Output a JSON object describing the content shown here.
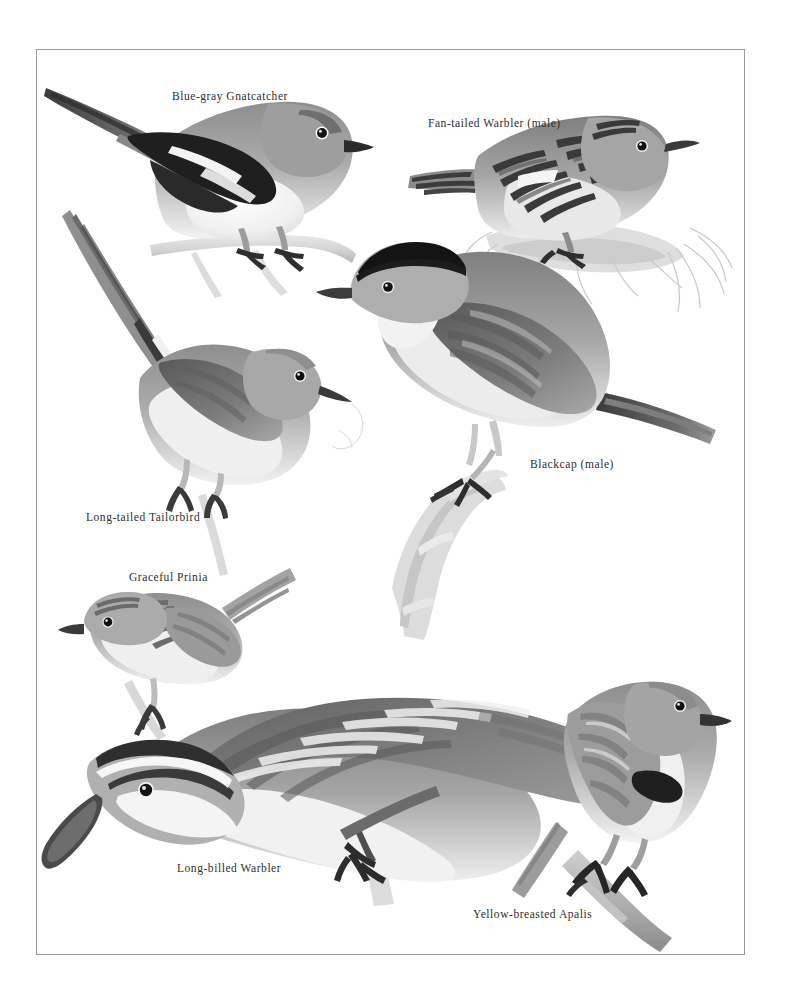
{
  "plate": {
    "kind": "field-guide-illustration-plate",
    "medium": "grayscale-watercolor-painting",
    "page_background": "#ffffff",
    "border_color": "#9a9a9a",
    "caption_color": "#2e2e2e",
    "ink_dark": "#2a2a2a",
    "ink_mid": "#8d8d8d",
    "ink_light": "#d6d6d6"
  },
  "captions": {
    "gnatcatcher": "Blue-gray Gnatcatcher",
    "fantailed_warbler": "Fan-tailed Warbler (male)",
    "blackcap": "Blackcap (male)",
    "tailorbird": "Long-tailed Tailorbird",
    "prinia": "Graceful Prinia",
    "longbilled_warbler": "Long-billed Warbler",
    "apalis": "Yellow-breasted Apalis"
  },
  "figures": [
    {
      "id": "gnatcatcher",
      "label": "Blue-gray Gnatcatcher",
      "facing": "right",
      "pose": "perched on twig, long tail swept to upper-left",
      "features": [
        "long black-and-white tail",
        "black wing with white edging",
        "blue-gray back",
        "white underparts",
        "fine black bill",
        "white eye-ring"
      ]
    },
    {
      "id": "fantailed_warbler",
      "label": "Fan-tailed Warbler (male)",
      "facing": "right",
      "pose": "perched on grass tussock",
      "features": [
        "heavily dark-streaked back",
        "buff underparts",
        "short fanned tail",
        "streaked crown"
      ]
    },
    {
      "id": "blackcap",
      "label": "Blackcap (male)",
      "facing": "left",
      "pose": "perched upright on lichen-covered branch",
      "features": [
        "solid black crown cap",
        "gray nape and back",
        "pale gray underparts",
        "long gray tail"
      ]
    },
    {
      "id": "tailorbird",
      "label": "Long-tailed Tailorbird",
      "facing": "right",
      "pose": "crouched on stem, tail raised steeply",
      "features": [
        "extremely long needle tail",
        "rufous crown",
        "pale whitish underparts",
        "slender decurved bill"
      ]
    },
    {
      "id": "prinia",
      "label": "Graceful Prinia",
      "facing": "left",
      "pose": "perched on thin stem, tail cocked up",
      "features": [
        "fine dark streaking above",
        "pale buff below",
        "long graduated tail",
        "short fine bill"
      ]
    },
    {
      "id": "longbilled_warbler",
      "label": "Long-billed Warbler",
      "facing": "left-down",
      "pose": "large descending pose, wings swept back",
      "features": [
        "very long decurved bill",
        "bold white supercilium",
        "dark crown stripes",
        "long pointed wings",
        "white underparts"
      ]
    },
    {
      "id": "apalis",
      "label": "Yellow-breasted Apalis",
      "facing": "right",
      "pose": "perched on angled branch",
      "features": [
        "dark breast band",
        "pale grey head",
        "white belly",
        "long tail",
        "short fine bill"
      ]
    }
  ]
}
